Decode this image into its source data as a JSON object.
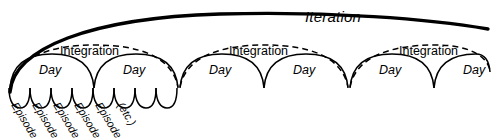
{
  "diagram": {
    "colors": {
      "stroke": "#000000",
      "background": "#ffffff"
    },
    "iteration": {
      "label": "Iteration",
      "style": "thick-solid-arc"
    },
    "integrations": [
      {
        "label": "Integration",
        "style": "dashed-arc"
      },
      {
        "label": "Integration",
        "style": "dashed-arc"
      },
      {
        "label": "Integration",
        "style": "dashed-arc"
      }
    ],
    "days": [
      {
        "label": "Day"
      },
      {
        "label": "Day"
      },
      {
        "label": "Day"
      },
      {
        "label": "Day"
      },
      {
        "label": "Day"
      },
      {
        "label": "Day"
      }
    ],
    "episodes": [
      {
        "label": "Episode"
      },
      {
        "label": "Episode"
      },
      {
        "label": "Episode"
      },
      {
        "label": "Episode"
      },
      {
        "label": "Episode"
      },
      {
        "label": "(etc.)"
      }
    ],
    "episode_arc_count": 8
  }
}
